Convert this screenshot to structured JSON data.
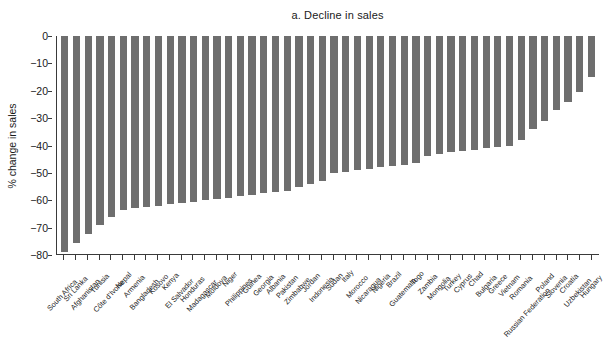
{
  "chart_data": {
    "type": "bar",
    "title": "a. Decline in sales",
    "xlabel": "",
    "ylabel": "% change in sales",
    "ylim": [
      -80,
      0
    ],
    "yticks": [
      0,
      -10,
      -20,
      -30,
      -40,
      -50,
      -60,
      -70,
      -80
    ],
    "ytick_labels": [
      "0",
      "−10",
      "−20",
      "−30",
      "−40",
      "−50",
      "−60",
      "−70",
      "−80"
    ],
    "grid": false,
    "legend": "none",
    "bar_color": "#6e6e6e",
    "axis_color": "#3a3a3a",
    "categories": [
      "South Africa",
      "Sri Lanka",
      "Afghanistan",
      "Tunisia",
      "Côte d'Ivoire",
      "Nepal",
      "Armenia",
      "Bangladesh",
      "Kosovo",
      "Kenya",
      "El Salvador",
      "Honduras",
      "Madagascar",
      "Moldova",
      "Niger",
      "Philippines",
      "Guinea",
      "Georgia",
      "Albania",
      "Pakistan",
      "Zimbabwe",
      "Jordan",
      "Indonesia",
      "Sudan",
      "Italy",
      "Morocco",
      "Nicaragua",
      "Nigeria",
      "Brazil",
      "Guatemala",
      "Togo",
      "Zambia",
      "Mongolia",
      "Turkey",
      "Cyprus",
      "Chad",
      "Bulgaria",
      "Greece",
      "Vietnam",
      "Romania",
      "Russian Federation",
      "Poland",
      "Slovenia",
      "Croatia",
      "Uzbekistan",
      "Hungary"
    ],
    "values": [
      -79.0,
      -75.5,
      -72.5,
      -69.0,
      -66.0,
      -63.5,
      -63.0,
      -62.5,
      -62.0,
      -61.5,
      -61.0,
      -60.5,
      -60.0,
      -59.5,
      -59.0,
      -58.5,
      -58.0,
      -57.5,
      -57.0,
      -56.5,
      -55.0,
      -54.0,
      -53.0,
      -50.0,
      -49.5,
      -49.0,
      -48.5,
      -48.0,
      -47.5,
      -47.0,
      -46.5,
      -44.0,
      -43.0,
      -42.5,
      -42.0,
      -41.5,
      -41.0,
      -40.5,
      -40.0,
      -38.0,
      -34.0,
      -31.0,
      -27.0,
      -24.0,
      -20.5,
      -15.0
    ]
  }
}
